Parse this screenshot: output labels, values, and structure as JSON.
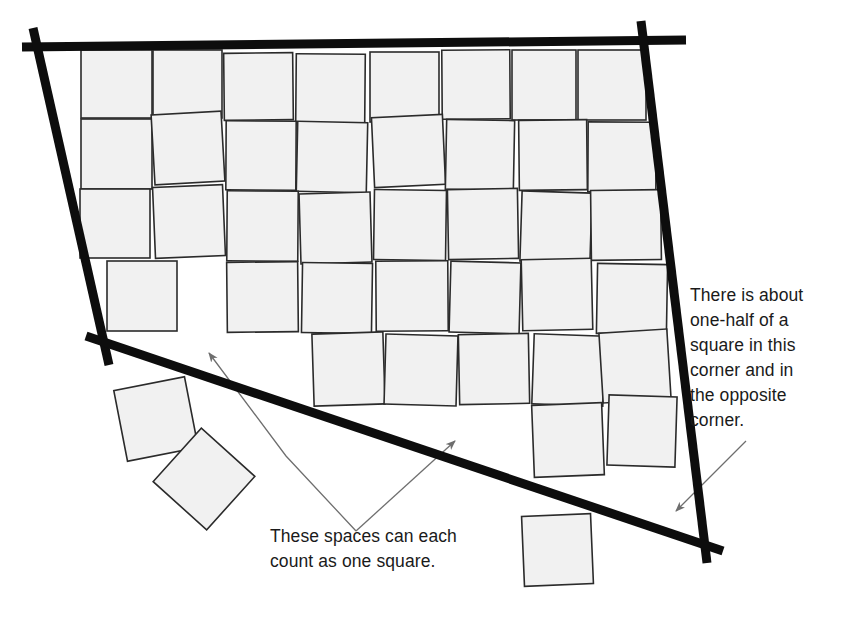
{
  "figure": {
    "background_color": "#ffffff",
    "square_fill": "#f1f1f1",
    "square_stroke": "#2b2b2b",
    "square_stroke_width": 1.6,
    "thick_line_color": "#0d0d0d",
    "thick_line_width": 9,
    "leader_color": "#6e6e6e",
    "leader_width": 1.3,
    "text_color": "#1a1a1a"
  },
  "annotations": {
    "right": {
      "name": "corner-note",
      "lines": [
        "There is about",
        "one-half of a",
        "square in this",
        "corner and in",
        "the opposite",
        "corner."
      ],
      "text": "There is about one-half of a square in this corner and in the opposite corner.",
      "x": 690,
      "y": 283
    },
    "bottom": {
      "name": "spaces-note",
      "lines": [
        "These spaces can each",
        "count as one square."
      ],
      "text": "These spaces can each count as one square.",
      "x": 270,
      "y": 524
    }
  },
  "boundary_lines": [
    {
      "name": "top-edge-line",
      "x1": 22,
      "y1": 47,
      "x2": 686,
      "y2": 40
    },
    {
      "name": "left-edge-line",
      "x1": 33,
      "y1": 28,
      "x2": 109,
      "y2": 365
    },
    {
      "name": "right-edge-line",
      "x1": 641,
      "y1": 21,
      "x2": 707,
      "y2": 563
    },
    {
      "name": "bottom-edge-line",
      "x1": 86,
      "y1": 336,
      "x2": 723,
      "y2": 551
    }
  ],
  "leaders": [
    {
      "name": "leader-to-space",
      "points": "356,531 286,456 209,353",
      "arrow_at": "209,353",
      "arrow_angle": -126.9
    },
    {
      "name": "leader-to-gap",
      "points": "356,531 455,441",
      "arrow_at": "455,441",
      "arrow_angle": -42.3
    },
    {
      "name": "leader-to-corner",
      "points": "746,441 676,511",
      "arrow_at": "676,511",
      "arrow_angle": 135
    }
  ],
  "squares": [
    {
      "x": 81,
      "y": 50,
      "w": 71,
      "h": 68,
      "r": 0
    },
    {
      "x": 153,
      "y": 50,
      "w": 69,
      "h": 68,
      "r": 0
    },
    {
      "x": 224,
      "y": 53,
      "w": 69,
      "h": 67,
      "r": -0.6
    },
    {
      "x": 296,
      "y": 54,
      "w": 69,
      "h": 70,
      "r": 0.5
    },
    {
      "x": 370,
      "y": 52,
      "w": 69,
      "h": 70,
      "r": 0
    },
    {
      "x": 442,
      "y": 50,
      "w": 68,
      "h": 69,
      "r": -0.4
    },
    {
      "x": 512,
      "y": 50,
      "w": 64,
      "h": 70,
      "r": 0
    },
    {
      "x": 578,
      "y": 50,
      "w": 68,
      "h": 70,
      "r": 0
    },
    {
      "x": 81,
      "y": 119,
      "w": 71,
      "h": 70,
      "r": 0
    },
    {
      "x": 153,
      "y": 113,
      "w": 70,
      "h": 70,
      "r": -3.2
    },
    {
      "x": 226,
      "y": 121,
      "w": 70,
      "h": 69,
      "r": 0.3
    },
    {
      "x": 297,
      "y": 122,
      "w": 70,
      "h": 70,
      "r": 1.2
    },
    {
      "x": 373,
      "y": 116,
      "w": 71,
      "h": 70,
      "r": -2.6
    },
    {
      "x": 446,
      "y": 120,
      "w": 68,
      "h": 70,
      "r": 1.1
    },
    {
      "x": 519,
      "y": 120,
      "w": 68,
      "h": 70,
      "r": -0.6
    },
    {
      "x": 588,
      "y": 122,
      "w": 68,
      "h": 70,
      "r": 0.3
    },
    {
      "x": 80,
      "y": 189,
      "w": 70,
      "h": 69,
      "r": 0
    },
    {
      "x": 154,
      "y": 186,
      "w": 70,
      "h": 71,
      "r": -2.4
    },
    {
      "x": 227,
      "y": 191,
      "w": 71,
      "h": 70,
      "r": 0.4
    },
    {
      "x": 300,
      "y": 193,
      "w": 71,
      "h": 70,
      "r": -1.6
    },
    {
      "x": 374,
      "y": 190,
      "w": 72,
      "h": 70,
      "r": 0.8
    },
    {
      "x": 448,
      "y": 189,
      "w": 70,
      "h": 70,
      "r": -1.0
    },
    {
      "x": 521,
      "y": 192,
      "w": 70,
      "h": 70,
      "r": 1.8
    },
    {
      "x": 591,
      "y": 190,
      "w": 70,
      "h": 70,
      "r": -0.7
    },
    {
      "x": 107,
      "y": 261,
      "w": 70,
      "h": 70,
      "r": 0
    },
    {
      "x": 227,
      "y": 262,
      "w": 71,
      "h": 70,
      "r": -0.6
    },
    {
      "x": 302,
      "y": 263,
      "w": 70,
      "h": 70,
      "r": 0.9
    },
    {
      "x": 376,
      "y": 261,
      "w": 72,
      "h": 70,
      "r": -0.4
    },
    {
      "x": 450,
      "y": 262,
      "w": 70,
      "h": 71,
      "r": 1.5
    },
    {
      "x": 522,
      "y": 259,
      "w": 70,
      "h": 71,
      "r": -1.3
    },
    {
      "x": 597,
      "y": 264,
      "w": 70,
      "h": 70,
      "r": 1.0
    },
    {
      "x": 313,
      "y": 333,
      "w": 71,
      "h": 72,
      "r": -1.8
    },
    {
      "x": 385,
      "y": 335,
      "w": 72,
      "h": 70,
      "r": 1.6
    },
    {
      "x": 459,
      "y": 334,
      "w": 70,
      "h": 70,
      "r": -1.1
    },
    {
      "x": 533,
      "y": 335,
      "w": 71,
      "h": 70,
      "r": 2.0
    },
    {
      "x": 601,
      "y": 331,
      "w": 68,
      "h": 70,
      "r": -3.5
    },
    {
      "x": 608,
      "y": 396,
      "w": 68,
      "h": 70,
      "r": 1.8
    },
    {
      "x": 533,
      "y": 404,
      "w": 70,
      "h": 72,
      "r": -2.2
    },
    {
      "x": 120,
      "y": 383,
      "w": 72,
      "h": 72,
      "r": -11
    },
    {
      "x": 168,
      "y": 443,
      "w": 72,
      "h": 72,
      "r": 42
    },
    {
      "x": 523,
      "y": 515,
      "w": 69,
      "h": 70,
      "r": -2.4
    }
  ]
}
